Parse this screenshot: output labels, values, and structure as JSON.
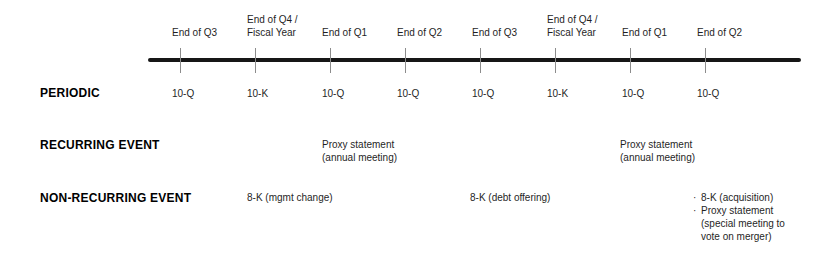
{
  "figure": {
    "background_color": "#ffffff",
    "axis_color": "#161616",
    "tick_color": "#8c8c8c",
    "text_color": "#1f1f1f"
  },
  "timeline": {
    "points": [
      {
        "label": "End of Q3"
      },
      {
        "label": "End of Q4 /\nFiscal Year"
      },
      {
        "label": "End of Q1"
      },
      {
        "label": "End of Q2"
      },
      {
        "label": "End of Q3"
      },
      {
        "label": "End of Q4 /\nFiscal Year"
      },
      {
        "label": "End of Q1"
      },
      {
        "label": "End of Q2"
      }
    ]
  },
  "rows": {
    "periodic": {
      "label": "PERIODIC",
      "values": [
        "10-Q",
        "10-K",
        "10-Q",
        "10-Q",
        "10-Q",
        "10-K",
        "10-Q",
        "10-Q"
      ]
    },
    "recurring": {
      "label": "RECURRING EVENT",
      "entries": [
        {
          "text": "Proxy statement\n(annual meeting)"
        },
        {
          "text": "Proxy statement\n(annual meeting)"
        }
      ]
    },
    "non_recurring": {
      "label": "NON-RECURRING EVENT",
      "bullet_char": "·",
      "entries": [
        {
          "text": "8-K (mgmt change)"
        },
        {
          "text": "8-K (debt offering)"
        },
        {
          "bullets": [
            "8-K (acquisition)",
            "Proxy statement\n(special meeting to\nvote on merger)"
          ]
        }
      ]
    }
  }
}
